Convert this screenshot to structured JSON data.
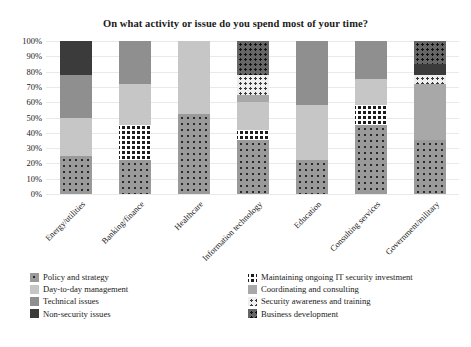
{
  "chart_data": {
    "type": "bar",
    "title": "On what activity or issue do you spend most of your time?",
    "xlabel": "",
    "ylabel": "",
    "ylim": [
      0,
      100
    ],
    "stacked": true,
    "grid": true,
    "legend_position": "bottom",
    "ytick_labels": [
      "100%",
      "90%",
      "80%",
      "70%",
      "60%",
      "50%",
      "40%",
      "30%",
      "20%",
      "10%",
      "0%"
    ],
    "ytick_values": [
      100,
      90,
      80,
      70,
      60,
      50,
      40,
      30,
      20,
      10,
      0
    ],
    "categories": [
      "Energy/utilities",
      "Banking/finance",
      "Healthcare",
      "Information technology",
      "Education",
      "Consulting services",
      "Government/military"
    ],
    "series": [
      {
        "name": "Policy and strategy",
        "key": "policy",
        "color": "#9a9a9a",
        "pattern": "dots-dark",
        "values": [
          25,
          22,
          52,
          35,
          22,
          45,
          35
        ]
      },
      {
        "name": "Maintaining ongoing IT security investment",
        "key": "maintaining",
        "color": "#1c1c1c",
        "pattern": "checker",
        "values": [
          0,
          23,
          0,
          7,
          0,
          13,
          0
        ]
      },
      {
        "name": "Day-to-day management",
        "key": "daytoday",
        "color": "#c6c6c6",
        "pattern": "solid",
        "values": [
          25,
          27,
          48,
          18,
          36,
          17,
          0
        ]
      },
      {
        "name": "Coordinating and consulting",
        "key": "coordinating",
        "color": "#a8a8a8",
        "pattern": "solid",
        "values": [
          0,
          0,
          0,
          5,
          0,
          0,
          37
        ]
      },
      {
        "name": "Technical issues",
        "key": "technical",
        "color": "#8f8f8f",
        "pattern": "solid",
        "values": [
          28,
          28,
          0,
          0,
          42,
          25,
          0
        ]
      },
      {
        "name": "Security awareness and training",
        "key": "awareness",
        "color": "#efefef",
        "pattern": "dots-light",
        "values": [
          0,
          0,
          0,
          13,
          0,
          0,
          6
        ]
      },
      {
        "name": "Non-security issues",
        "key": "nonsecurity",
        "color": "#3b3b3b",
        "pattern": "solid",
        "values": [
          22,
          0,
          0,
          0,
          0,
          0,
          7
        ]
      },
      {
        "name": "Business development",
        "key": "business",
        "color": "#666666",
        "pattern": "dots-on-gray",
        "values": [
          0,
          0,
          0,
          22,
          0,
          0,
          15
        ]
      }
    ],
    "legend": {
      "column_1": [
        "Policy and strategy",
        "Day-to-day management",
        "Technical issues",
        "Non-security issues"
      ],
      "column_2": [
        "Maintaining ongoing IT security investment",
        "Coordinating and consulting",
        "Security awareness and training",
        "Business development"
      ]
    }
  }
}
